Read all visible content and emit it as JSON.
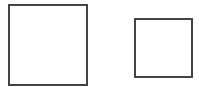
{
  "diagram": {
    "shapes": [
      {
        "type": "square",
        "label": "",
        "size": "large",
        "stroke": "#444444",
        "fill": "#ffffff"
      },
      {
        "type": "square",
        "label": "",
        "size": "small",
        "stroke": "#444444",
        "fill": "#ffffff"
      }
    ]
  }
}
